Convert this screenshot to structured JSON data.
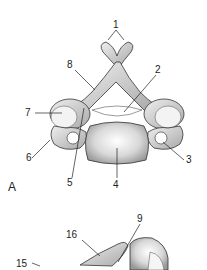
{
  "panels": [
    {
      "id": "A",
      "label": "A",
      "view": "superior view of cervical vertebra",
      "callouts": [
        {
          "num": "1",
          "x": 116,
          "y": 22
        },
        {
          "num": "2",
          "x": 157,
          "y": 67
        },
        {
          "num": "3",
          "x": 187,
          "y": 156
        },
        {
          "num": "4",
          "x": 113,
          "y": 182
        },
        {
          "num": "5",
          "x": 67,
          "y": 179
        },
        {
          "num": "6",
          "x": 27,
          "y": 155
        },
        {
          "num": "7",
          "x": 26,
          "y": 110
        },
        {
          "num": "8",
          "x": 67,
          "y": 62
        }
      ]
    },
    {
      "id": "B",
      "label": "",
      "view": "lateral view of cervical vertebra (partial)",
      "callouts": [
        {
          "num": "9",
          "x": 138,
          "y": 216
        },
        {
          "num": "16",
          "x": 68,
          "y": 232
        },
        {
          "num": "15",
          "x": 18,
          "y": 261
        }
      ]
    }
  ],
  "colors": {
    "bone_light": "#f1f1f1",
    "bone_mid": "#c9c9c9",
    "bone_dark": "#8a8a8a",
    "outline": "#333333",
    "text": "#222222"
  }
}
